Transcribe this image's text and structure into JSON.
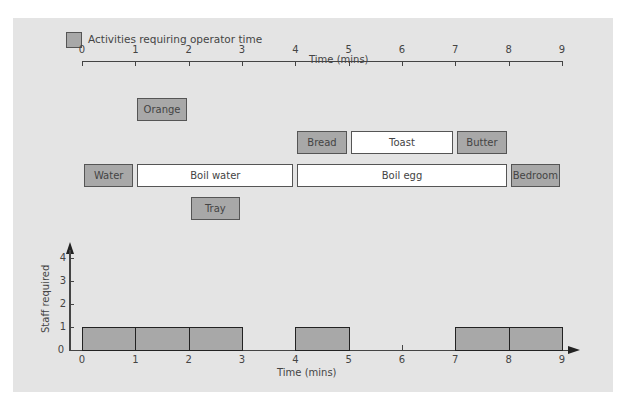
{
  "legend": {
    "label": "Activities requiring operator time",
    "swatch_color": "#a8a8a8"
  },
  "top_axis": {
    "title": "Time (mins)",
    "ticks": [
      "0",
      "1",
      "2",
      "3",
      "4",
      "5",
      "6",
      "7",
      "8",
      "9"
    ]
  },
  "activities": [
    {
      "label": "Orange",
      "start": 1,
      "end": 2,
      "row": 0,
      "operator": true
    },
    {
      "label": "Bread",
      "start": 4,
      "end": 5,
      "row": 1,
      "operator": true
    },
    {
      "label": "Toast",
      "start": 5,
      "end": 7,
      "row": 1,
      "operator": false
    },
    {
      "label": "Butter",
      "start": 7,
      "end": 8,
      "row": 1,
      "operator": true
    },
    {
      "label": "Water",
      "start": 0,
      "end": 1,
      "row": 2,
      "operator": true
    },
    {
      "label": "Boil water",
      "start": 1,
      "end": 4,
      "row": 2,
      "operator": false
    },
    {
      "label": "Boil egg",
      "start": 4,
      "end": 8,
      "row": 2,
      "operator": false
    },
    {
      "label": "Bedroom",
      "start": 8,
      "end": 9,
      "row": 2,
      "operator": true
    },
    {
      "label": "Tray",
      "start": 2,
      "end": 3,
      "row": 3,
      "operator": true
    }
  ],
  "bottom_chart": {
    "ylabel": "Staff required",
    "xlabel": "Time (mins)",
    "yticks": [
      "0",
      "1",
      "2",
      "3",
      "4"
    ],
    "xticks": [
      "0",
      "1",
      "2",
      "3",
      "4",
      "5",
      "6",
      "7",
      "8",
      "9"
    ]
  },
  "chart_data": {
    "type": "bar",
    "title": "",
    "xlabel": "Time (mins)",
    "ylabel": "Staff required",
    "categories": [
      "0-1",
      "1-2",
      "2-3",
      "3-4",
      "4-5",
      "5-6",
      "6-7",
      "7-8",
      "8-9"
    ],
    "values": [
      1,
      1,
      1,
      0,
      1,
      0,
      0,
      1,
      1
    ],
    "ylim": [
      0,
      4
    ],
    "xlim": [
      0,
      9
    ],
    "grid": false,
    "legend": "Activities requiring operator time"
  },
  "colors": {
    "operator": "#a8a8a8",
    "non_operator": "#ffffff",
    "background": "#e4e4e4"
  }
}
